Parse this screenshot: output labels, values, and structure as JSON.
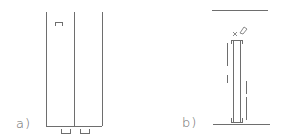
{
  "diagram": {
    "panels": [
      {
        "id": "a",
        "label": "a)",
        "label_pos": [
          16,
          116
        ],
        "verticals": [
          {
            "x": 46,
            "y1": 12,
            "y2": 126
          },
          {
            "x": 74,
            "y1": 12,
            "y2": 126
          },
          {
            "x": 102,
            "y1": 12,
            "y2": 126
          }
        ],
        "bottom_line": {
          "x1": 46,
          "x2": 102,
          "y": 126
        },
        "top_bracket": {
          "x1": 55,
          "x2": 62,
          "y": 22,
          "h": 4,
          "orientation": "down"
        },
        "bottom_brackets": [
          {
            "x1": 61,
            "x2": 70,
            "y": 133,
            "h": 4,
            "orientation": "up"
          },
          {
            "x1": 80,
            "x2": 89,
            "y": 133,
            "h": 4,
            "orientation": "up"
          }
        ]
      },
      {
        "id": "b",
        "label": "b)",
        "label_pos": [
          182,
          115
        ],
        "top_line": {
          "x1": 212,
          "x2": 268,
          "y": 10
        },
        "bottom_line": {
          "x1": 213,
          "x2": 270,
          "y": 124
        },
        "column": {
          "x_left": 233,
          "x_right": 240,
          "top": 40,
          "bottom": 122
        },
        "cross_mark": {
          "x": 235,
          "y": 34,
          "text": "×"
        },
        "pencil_mark": {
          "x": 243,
          "y": 28
        },
        "dashed_left": {
          "x": 227,
          "segments": [
            [
              43,
              66
            ],
            [
              75,
              83
            ]
          ]
        },
        "dashed_right": {
          "x": 246,
          "segments": [
            [
              81,
              94
            ],
            [
              97,
              120
            ]
          ]
        }
      }
    ]
  }
}
